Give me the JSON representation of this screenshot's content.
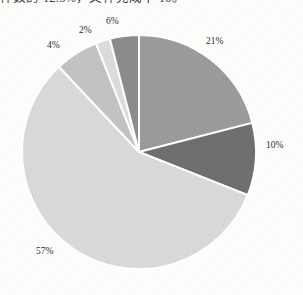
{
  "page": {
    "background_color": "#fdfdfc",
    "header_text_clipped": "件数的 12.5%，文件完成十 10。"
  },
  "chart_data": {
    "type": "pie",
    "title": "",
    "subtitle": "",
    "xlabel": "",
    "ylabel": "",
    "legend": "none",
    "grid": false,
    "labels_position": "outside",
    "start_angle_deg": 0,
    "direction": "clockwise",
    "categories": [
      "21%",
      "10%",
      "57%",
      "6%",
      "2%",
      "4%"
    ],
    "values": [
      21,
      10,
      57,
      6,
      2,
      4
    ],
    "slices": [
      {
        "label": "21%",
        "value": 21,
        "color": "#9a9a9a",
        "label_x": 206,
        "label_y": 36
      },
      {
        "label": "10%",
        "value": 10,
        "color": "#6e6e6e",
        "label_x": 266,
        "label_y": 140
      },
      {
        "label": "57%",
        "value": 57,
        "color": "#d9d9d9",
        "label_x": 36,
        "label_y": 246
      },
      {
        "label": "6%",
        "value": 6,
        "color": "#c2c2c2",
        "label_x": 106,
        "label_y": 16
      },
      {
        "label": "2%",
        "value": 2,
        "color": "#dcdcdc",
        "label_x": 79,
        "label_y": 25
      },
      {
        "label": "4%",
        "value": 4,
        "color": "#8b8b8b",
        "label_x": 47,
        "label_y": 40
      }
    ],
    "geometry": {
      "cx": 139,
      "cy": 152,
      "r": 117,
      "separator_color": "#ffffff",
      "separator_width": 2
    }
  }
}
